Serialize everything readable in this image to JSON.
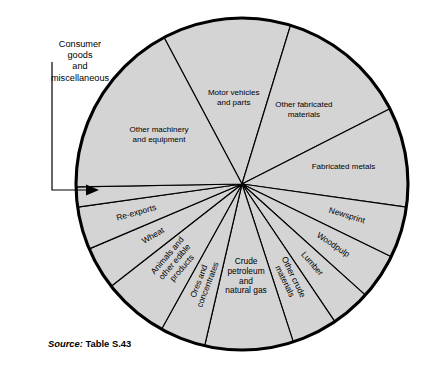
{
  "figure": {
    "source_prefix": "Source:",
    "source_reference": "Table S.43",
    "callout": {
      "lines": [
        "Consumer",
        "goods",
        "and",
        "miscellaneous"
      ],
      "target_label": "Consumer goods and miscellaneous"
    },
    "colors": {
      "slice_fill": "#d4d4d4",
      "slice_stroke": "#000000",
      "outline": "#000000",
      "background": "#ffffff",
      "text": "#000000"
    }
  },
  "chart_data": {
    "type": "pie",
    "title": "",
    "subtitle": "",
    "xlabel": "",
    "ylabel": "",
    "legend": "none",
    "grid": false,
    "labels_placement": "inside-slices",
    "center": {
      "x": 242,
      "y": 184
    },
    "radius": 166,
    "start_angle_deg": -118,
    "total_degrees": 360,
    "categories": [
      "Motor vehicles and parts",
      "Other fabricated materials",
      "Fabricated metals",
      "Newsprint",
      "Woodpulp",
      "Lumber",
      "Other crude materials",
      "Crude petroleum and natural gas",
      "Ores and concentrates",
      "Animals and other edible products",
      "Wheat",
      "Re-exports",
      "Consumer goods and miscellaneous",
      "Other machinery and equipment"
    ],
    "values": [
      45,
      46,
      35,
      18,
      16,
      14,
      16,
      31,
      16,
      23,
      15,
      15,
      7,
      63
    ],
    "units": "degrees of arc",
    "slices": [
      {
        "label": "Motor vehicles and parts",
        "label_lines": [
          "Motor vehicles",
          "and parts"
        ],
        "start_deg": -118,
        "end_deg": -73,
        "sweep_deg": 45,
        "percent": 12.5,
        "label_radius_frac": 0.52,
        "rotate": false
      },
      {
        "label": "Other fabricated materials",
        "label_lines": [
          "Other fabricated",
          "materials"
        ],
        "start_deg": -73,
        "end_deg": -27,
        "sweep_deg": 46,
        "percent": 12.8,
        "label_radius_frac": 0.58,
        "rotate": false
      },
      {
        "label": "Fabricated metals",
        "label_lines": [
          "Fabricated metals"
        ],
        "start_deg": -27,
        "end_deg": 8,
        "sweep_deg": 35,
        "percent": 9.7,
        "label_radius_frac": 0.62,
        "rotate": false
      },
      {
        "label": "Newsprint",
        "label_lines": [
          "Newsprint"
        ],
        "start_deg": 8,
        "end_deg": 26,
        "sweep_deg": 18,
        "percent": 5.0,
        "label_radius_frac": 0.66,
        "rotate": true
      },
      {
        "label": "Woodpulp",
        "label_lines": [
          "Woodpulp"
        ],
        "start_deg": 26,
        "end_deg": 42,
        "sweep_deg": 16,
        "percent": 4.4,
        "label_radius_frac": 0.66,
        "rotate": true
      },
      {
        "label": "Lumber",
        "label_lines": [
          "Lumber"
        ],
        "start_deg": 42,
        "end_deg": 56,
        "sweep_deg": 14,
        "percent": 3.9,
        "label_radius_frac": 0.64,
        "rotate": true
      },
      {
        "label": "Other crude materials",
        "label_lines": [
          "Other crude",
          "materials"
        ],
        "start_deg": 56,
        "end_deg": 72,
        "sweep_deg": 16,
        "percent": 4.4,
        "label_radius_frac": 0.64,
        "rotate": true
      },
      {
        "label": "Crude petroleum and natural gas",
        "label_lines": [
          "Crude",
          "petroleum",
          "and",
          "natural gas"
        ],
        "start_deg": 72,
        "end_deg": 103,
        "sweep_deg": 31,
        "percent": 8.6,
        "label_radius_frac": 0.56,
        "rotate": false
      },
      {
        "label": "Ores and concentrates",
        "label_lines": [
          "Ores and",
          "concentrates"
        ],
        "start_deg": 103,
        "end_deg": 119,
        "sweep_deg": 16,
        "percent": 4.4,
        "label_radius_frac": 0.64,
        "rotate": true
      },
      {
        "label": "Animals and other edible products",
        "label_lines": [
          "Animals and",
          "other edible",
          "products"
        ],
        "start_deg": 119,
        "end_deg": 142,
        "sweep_deg": 23,
        "percent": 6.4,
        "label_radius_frac": 0.62,
        "rotate": true
      },
      {
        "label": "Wheat",
        "label_lines": [
          "Wheat"
        ],
        "start_deg": 142,
        "end_deg": 157,
        "sweep_deg": 15,
        "percent": 4.2,
        "label_radius_frac": 0.62,
        "rotate": true
      },
      {
        "label": "Re-exports",
        "label_lines": [
          "Re-exports"
        ],
        "start_deg": 157,
        "end_deg": 172,
        "sweep_deg": 15,
        "percent": 4.2,
        "label_radius_frac": 0.66,
        "rotate": true
      },
      {
        "label": "Consumer goods and miscellaneous",
        "label_lines": [],
        "start_deg": 172,
        "end_deg": 179,
        "sweep_deg": 7,
        "percent": 1.9,
        "label_radius_frac": 0,
        "rotate": false,
        "labeled_by_callout": true
      },
      {
        "label": "Other machinery and equipment",
        "label_lines": [
          "Other machinery",
          "and equipment"
        ],
        "start_deg": 179,
        "end_deg": 242,
        "sweep_deg": 63,
        "percent": 17.5,
        "label_radius_frac": 0.58,
        "rotate": false
      }
    ]
  }
}
